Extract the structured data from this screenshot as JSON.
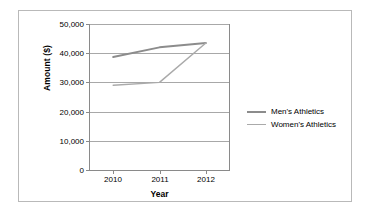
{
  "chart_data": {
    "type": "line",
    "title": "",
    "xlabel": "Year",
    "ylabel": "Amount ($)",
    "categories": [
      "2010",
      "2011",
      "2012"
    ],
    "x": [
      2010,
      2011,
      2012
    ],
    "series": [
      {
        "name": "Men's Athletics",
        "values": [
          38700,
          42000,
          43500
        ],
        "color": "#8c8c8c",
        "line_width": 2
      },
      {
        "name": "Women's Athletics",
        "values": [
          29000,
          30000,
          43500
        ],
        "color": "#aaaaaa",
        "line_width": 1.4
      }
    ],
    "ylim": [
      0,
      50000
    ],
    "yticks": [
      0,
      10000,
      20000,
      30000,
      40000,
      50000
    ],
    "ytick_labels": [
      "0",
      "10,000",
      "20,000",
      "30,000",
      "40,000",
      "50,000"
    ],
    "grid": true,
    "grid_axis": "y",
    "legend_position": "right",
    "frame": true,
    "colors": {
      "background": "#ffffff",
      "figure_border": "#b9b9b9",
      "axis": "#8a8a8a",
      "gridline": "#a8a8a8",
      "text": "#000000"
    }
  },
  "axes": {
    "y_title": "Amount ($)",
    "x_title": "Year"
  },
  "legend": {
    "items": [
      {
        "label": "Men's Athletics"
      },
      {
        "label": "Women's Athletics"
      }
    ]
  }
}
